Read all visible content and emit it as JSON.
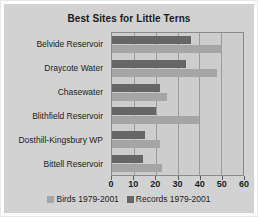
{
  "chart_data": {
    "type": "bar",
    "orientation": "horizontal",
    "title": "Best Sites for Little Terns",
    "xlabel": "",
    "ylabel": "",
    "xlim": [
      0,
      60
    ],
    "xticks": [
      0,
      10,
      20,
      30,
      40,
      50,
      60
    ],
    "grid": true,
    "legend_position": "bottom",
    "categories": [
      "Belvide Reservoir",
      "Draycote Water",
      "Chasewater",
      "Blithfield Reservoir",
      "Dosthill-Kingsbury WP",
      "Bittell Reservoir"
    ],
    "series": [
      {
        "name": "Records 1979-2001",
        "color": "#666666",
        "values": [
          36,
          34,
          22,
          20,
          15,
          14
        ]
      },
      {
        "name": "Birds 1979-2001",
        "color": "#a5a5a5",
        "values": [
          50,
          48,
          25,
          40,
          22,
          23
        ]
      }
    ]
  },
  "legend": {
    "entries": [
      {
        "label": "Birds 1979-2001",
        "color": "#a5a5a5"
      },
      {
        "label": "Records 1979-2001",
        "color": "#666666"
      }
    ]
  },
  "colors": {
    "background": "#d2d2d2",
    "plot_background": "#cdcdcd",
    "axis": "#8a8a8a",
    "gridline": "#9b9b9b",
    "text": "#1c1c1c"
  }
}
